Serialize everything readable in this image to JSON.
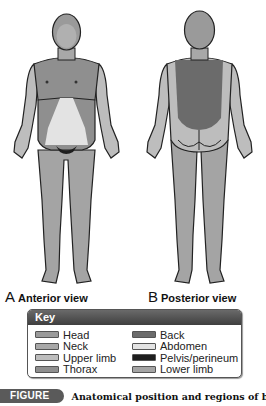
{
  "views": {
    "anterior": {
      "letter": "A",
      "label": "Anterior view"
    },
    "posterior": {
      "letter": "B",
      "label": "Posterior view"
    }
  },
  "key": {
    "title": "Key",
    "items": [
      {
        "label": "Head",
        "color": "#9a9a9a"
      },
      {
        "label": "Neck",
        "color": "#a8a8a8"
      },
      {
        "label": "Upper limb",
        "color": "#bdbdbd"
      },
      {
        "label": "Thorax",
        "color": "#8f8f8f"
      },
      {
        "label": "Back",
        "color": "#6b6b6b"
      },
      {
        "label": "Abdomen",
        "color": "#e3e3e3"
      },
      {
        "label": "Pelvis/perineum",
        "color": "#1e1e1e"
      },
      {
        "label": "Lower limb",
        "color": "#a4a4a4"
      }
    ]
  },
  "caption": {
    "tag": "FIGURE I.1.",
    "text": "Anatomical position and regions of body."
  }
}
